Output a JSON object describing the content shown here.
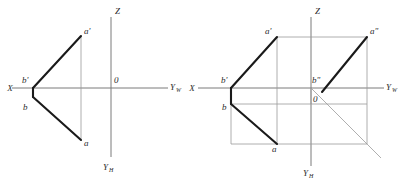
{
  "figure": {
    "background_color": "#ffffff",
    "axis_color": "#7a7a7a",
    "box_color": "#9a9a9a",
    "segment_color": "#1a1a1a",
    "label_color": "#2b2b2b"
  },
  "left_view": {
    "name": "two-view-projection",
    "axes": {
      "x_label": "X",
      "z_label": "Z",
      "yw_label": "Y",
      "yw_sub": "W",
      "yh_label": "Y",
      "yh_sub": "H",
      "origin_label": "0"
    },
    "points": [
      {
        "id": "a-prime",
        "label": "a'"
      },
      {
        "id": "b-prime",
        "label": "b'"
      },
      {
        "id": "b",
        "label": "b"
      },
      {
        "id": "a",
        "label": "a"
      }
    ]
  },
  "right_view": {
    "name": "three-view-projection",
    "axes": {
      "x_label": "X",
      "z_label": "Z",
      "yw_label": "Y",
      "yw_sub": "W",
      "yh_label": "Y",
      "yh_sub": "H",
      "origin_label": "0"
    },
    "points": [
      {
        "id": "a-prime",
        "label": "a'"
      },
      {
        "id": "a-double-prime",
        "label": "a\""
      },
      {
        "id": "b-prime",
        "label": "b'"
      },
      {
        "id": "b-double-prime",
        "label": "b\""
      },
      {
        "id": "b",
        "label": "b"
      },
      {
        "id": "a",
        "label": "a"
      }
    ]
  }
}
